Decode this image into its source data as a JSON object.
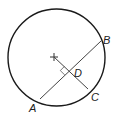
{
  "diagram": {
    "type": "geometry",
    "colors": {
      "circle": "#1a1a1a",
      "lines": "#444444",
      "labels": "#222222",
      "background": "#ffffff"
    },
    "circle": {
      "cx": 56.5,
      "cy": 57.5,
      "r": 48.5
    },
    "center": {
      "x": 54,
      "y": 57
    },
    "points": {
      "A": {
        "label": "A",
        "x": 40,
        "y": 99
      },
      "B": {
        "label": "B",
        "x": 101,
        "y": 41
      },
      "C": {
        "label": "C",
        "x": 88,
        "y": 89
      },
      "D": {
        "label": "D",
        "x": 69,
        "y": 71
      }
    },
    "labels": {
      "A": "A",
      "B": "B",
      "C": "C",
      "D": "D"
    },
    "segments": [
      {
        "name": "chord-AB",
        "from": "A",
        "to": "B"
      },
      {
        "name": "radius-OC",
        "from": "center",
        "to": "C"
      }
    ],
    "right_angle_at": "D"
  }
}
